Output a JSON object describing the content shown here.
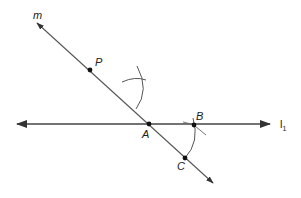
{
  "diagram": {
    "type": "geometric-construction",
    "colors": {
      "line": "#444444",
      "point": "#111111",
      "text": "#222222"
    },
    "lines": [
      {
        "name": "m",
        "label": "m",
        "from": [
          37,
          23
        ],
        "to": [
          213,
          183
        ],
        "arrows": "both"
      },
      {
        "name": "l1",
        "label": "l",
        "subscript": "1",
        "from": [
          17,
          124
        ],
        "to": [
          270,
          124
        ],
        "arrows": "both"
      }
    ],
    "points": [
      {
        "name": "P",
        "label": "P",
        "x": 90,
        "y": 70
      },
      {
        "name": "A",
        "label": "A",
        "x": 149,
        "y": 124
      },
      {
        "name": "B",
        "label": "B",
        "x": 194,
        "y": 125
      },
      {
        "name": "C",
        "label": "C",
        "x": 185,
        "y": 158
      }
    ],
    "arcs": [
      {
        "name": "upper-arc",
        "center": "A"
      },
      {
        "name": "lower-arc",
        "center": "A"
      }
    ]
  }
}
